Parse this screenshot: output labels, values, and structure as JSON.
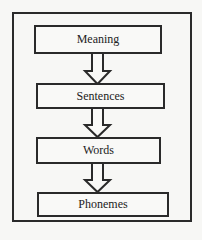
{
  "diagram": {
    "type": "hierarchy-flow",
    "direction": "top-to-bottom",
    "levels": [
      {
        "label": "Meaning"
      },
      {
        "label": "Sentences"
      },
      {
        "label": "Words"
      },
      {
        "label": "Phonemes"
      }
    ],
    "edges": [
      {
        "from": "Meaning",
        "to": "Sentences",
        "style": "hollow-block-arrow"
      },
      {
        "from": "Sentences",
        "to": "Words",
        "style": "hollow-block-arrow"
      },
      {
        "from": "Words",
        "to": "Phonemes",
        "style": "hollow-block-arrow"
      }
    ],
    "colors": {
      "stroke": "#2a2a2a",
      "background": "#f7f7f5",
      "text": "#222222"
    }
  }
}
